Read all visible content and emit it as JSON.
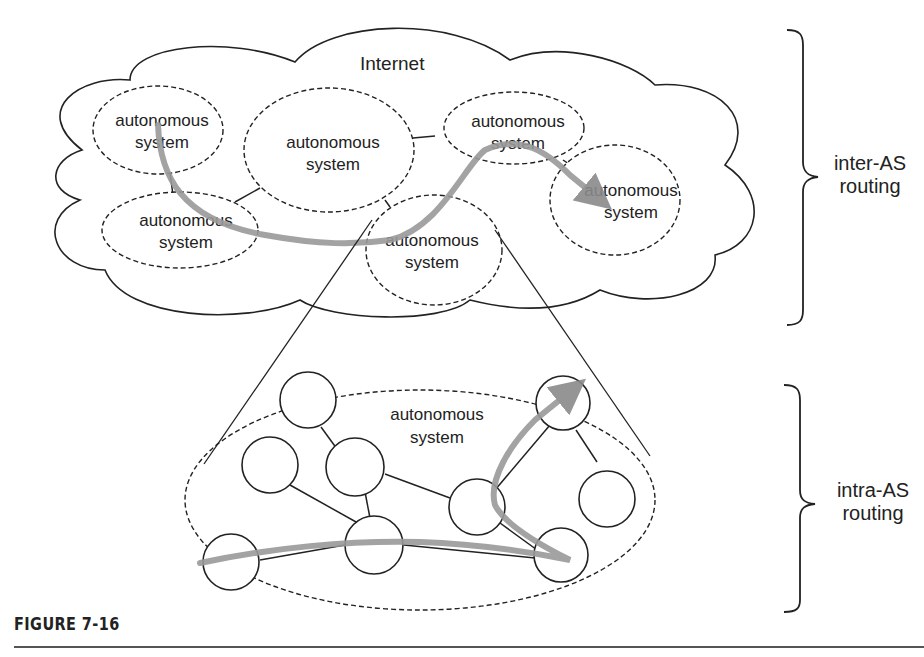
{
  "figure": {
    "caption": "FIGURE 7-16",
    "cloud_label": "Internet",
    "as_label_line1": "autonomous",
    "as_label_line2": "system",
    "inter_label_line1": "inter-AS",
    "inter_label_line2": "routing",
    "intra_label_line1": "intra-AS",
    "intra_label_line2": "routing",
    "inter_as_nodes": [
      {
        "id": "as1",
        "line1": "autonomous",
        "line2": "system"
      },
      {
        "id": "as2",
        "line1": "autonomous",
        "line2": "system"
      },
      {
        "id": "as3",
        "line1": "autonomous",
        "line2": "system"
      },
      {
        "id": "as4",
        "line1": "autonomous",
        "line2": "system"
      },
      {
        "id": "as5",
        "line1": "autonomous",
        "line2": "system"
      },
      {
        "id": "as6",
        "line1": "autonomous",
        "line2": "system"
      }
    ],
    "intra_as_label_line1": "autonomous",
    "intra_as_label_line2": "system",
    "colors": {
      "line": "#222222",
      "route_arrow": "#999999",
      "background": "#ffffff"
    }
  }
}
